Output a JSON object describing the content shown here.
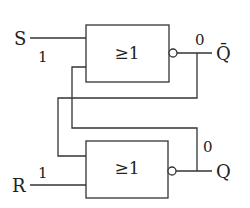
{
  "diagram": {
    "type": "NOR-gate SR latch",
    "colors": {
      "line": "#333333",
      "text": "#222222",
      "background": "#ffffff"
    },
    "gates": [
      {
        "id": "top-gate",
        "label": "≥1",
        "inverted_output": true
      },
      {
        "id": "bottom-gate",
        "label": "≥1",
        "inverted_output": true
      }
    ],
    "inputs": [
      {
        "name": "S",
        "value": "1"
      },
      {
        "name": "R",
        "value": "1"
      }
    ],
    "outputs": [
      {
        "name": "Q̄",
        "value": "0"
      },
      {
        "name": "Q",
        "value": "0"
      }
    ]
  }
}
